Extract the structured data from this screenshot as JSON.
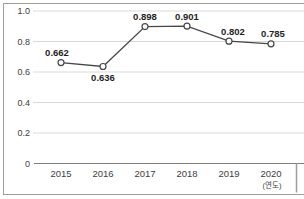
{
  "chart_data": {
    "type": "line",
    "categories": [
      "2015",
      "2016",
      "2017",
      "2018",
      "2019",
      "2020"
    ],
    "values": [
      0.662,
      0.636,
      0.898,
      0.901,
      0.802,
      0.785
    ],
    "value_labels": [
      "0.662",
      "0.636",
      "0.898",
      "0.901",
      "0.802",
      "0.785"
    ],
    "label_side": [
      "above",
      "below",
      "above",
      "above",
      "above",
      "above"
    ],
    "label_dx": [
      -4,
      0,
      0,
      0,
      4,
      2
    ],
    "y_ticks": [
      0,
      0.2,
      0.4,
      0.6,
      0.8,
      1.0
    ],
    "y_tick_labels": [
      "0",
      "0.2",
      "0.4",
      "0.6",
      "0.8",
      "1.0"
    ],
    "ylim": [
      0,
      1.0
    ],
    "x_axis_unit_label": "(연도)",
    "title": "",
    "xlabel": "",
    "ylabel": "",
    "grid": true,
    "legend": "none",
    "marker": "open-circle"
  },
  "colors": {
    "background": "#ffffff",
    "frame_border": "#9e9e9e",
    "gridline": "#d9d9d9",
    "axis_line": "#808080",
    "series_line": "#474747",
    "marker_fill": "#ffffff",
    "marker_stroke": "#474747",
    "data_label": "#1f1f1f",
    "tick_label": "#3d3d3d",
    "end_divider": "#9e9e9e"
  }
}
